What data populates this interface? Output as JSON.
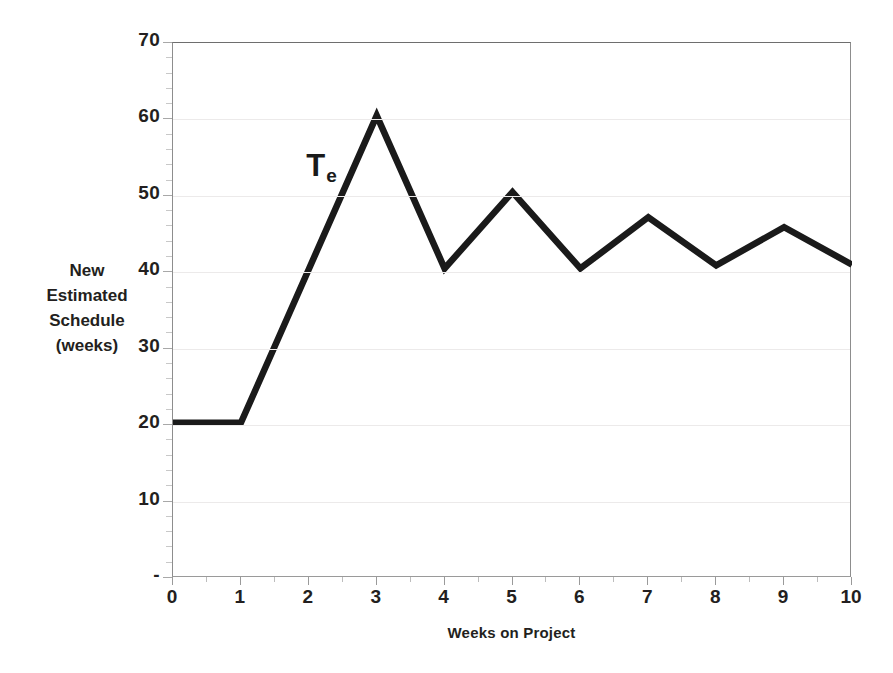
{
  "chart_data": {
    "type": "line",
    "title": "",
    "xlabel": "Weeks on Project",
    "ylabel": "New Estimated Schedule (weeks)",
    "ylabel_lines": [
      "New",
      "Estimated",
      "Schedule",
      "(weeks)"
    ],
    "x": [
      0,
      1,
      2,
      3,
      4,
      5,
      6,
      7,
      8,
      9,
      10
    ],
    "values": [
      20.3,
      20.3,
      40.4,
      60.5,
      40.5,
      50.5,
      40.5,
      47.2,
      40.9,
      45.9,
      41.0
    ],
    "series": [
      {
        "name": "Te",
        "values": [
          20.3,
          20.3,
          40.4,
          60.5,
          40.5,
          50.5,
          40.5,
          47.2,
          40.9,
          45.9,
          41.0
        ]
      }
    ],
    "xlim": [
      0,
      10
    ],
    "ylim": [
      0,
      70
    ],
    "xticks": [
      "0",
      "1",
      "2",
      "3",
      "4",
      "5",
      "6",
      "7",
      "8",
      "9",
      "10"
    ],
    "ytick_values": [
      0,
      10,
      20,
      30,
      40,
      50,
      60,
      70
    ],
    "yticks": [
      "-",
      "10",
      "20",
      "30",
      "40",
      "50",
      "60",
      "70"
    ],
    "grid": "horizontal",
    "legend": "none",
    "annotations": [
      {
        "text": "T",
        "subscript": "e",
        "x": 2.05,
        "y": 53.5
      }
    ],
    "line_color": "#1a1a1a",
    "grid_color": "#eceaea",
    "axis_color": "#8d8d8d",
    "background": "#ffffff"
  }
}
